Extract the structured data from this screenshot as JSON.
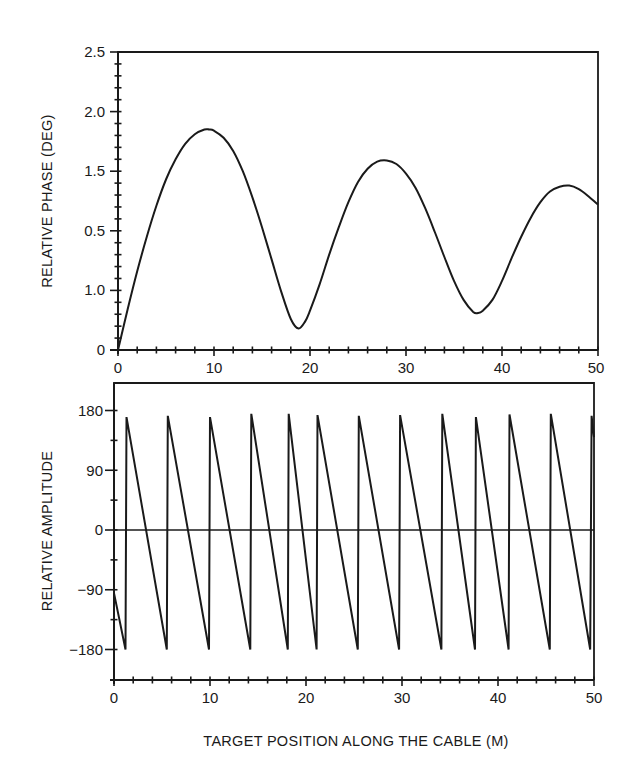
{
  "chart_data": [
    {
      "id": "phase",
      "type": "line",
      "title": "",
      "xlabel": "",
      "ylabel": "RELATIVE PHASE (DEG)",
      "xlim": [
        0,
        50
      ],
      "ylim": [
        0,
        2.5
      ],
      "x_ticks": [
        0,
        10,
        20,
        30,
        40,
        50
      ],
      "x_tick_labels": [
        "0",
        "10",
        "20",
        "30",
        "40",
        "50"
      ],
      "y_ticks": [
        2.5,
        2.0,
        1.5,
        1.0,
        0.5,
        0
      ],
      "y_tick_labels": [
        "2.5",
        "2.0",
        "1.5",
        "0.5",
        "1.0",
        "0"
      ],
      "grid": false,
      "legend": null,
      "series": [
        {
          "name": "Relative phase",
          "x": [
            0,
            1,
            2,
            3,
            4,
            5,
            6,
            7,
            8,
            9,
            9.5,
            10,
            11,
            12,
            13,
            14,
            15,
            16,
            17,
            18,
            18.8,
            19.5,
            20,
            21,
            22,
            23,
            24,
            25,
            26,
            27,
            28,
            29,
            30,
            31,
            32,
            33,
            34,
            35,
            36,
            37,
            37.5,
            38,
            39,
            40,
            41,
            42,
            43,
            44,
            45,
            46,
            47,
            48,
            49,
            50
          ],
          "values": [
            0,
            0.34,
            0.66,
            0.95,
            1.21,
            1.43,
            1.6,
            1.73,
            1.81,
            1.85,
            1.85,
            1.84,
            1.78,
            1.67,
            1.5,
            1.28,
            1.03,
            0.76,
            0.49,
            0.26,
            0.18,
            0.24,
            0.33,
            0.55,
            0.8,
            1.03,
            1.24,
            1.41,
            1.52,
            1.58,
            1.59,
            1.56,
            1.48,
            1.36,
            1.19,
            0.99,
            0.78,
            0.58,
            0.42,
            0.32,
            0.31,
            0.33,
            0.42,
            0.58,
            0.77,
            0.95,
            1.11,
            1.24,
            1.33,
            1.37,
            1.38,
            1.35,
            1.29,
            1.22
          ]
        }
      ]
    },
    {
      "id": "amplitude",
      "type": "line",
      "title": "",
      "xlabel": "TARGET POSITION ALONG THE CABLE (M)",
      "ylabel": "RELATIVE AMPLITUDE",
      "xlim": [
        0,
        50
      ],
      "ylim": [
        -225,
        225
      ],
      "x_ticks": [
        0,
        10,
        20,
        30,
        40,
        50
      ],
      "x_tick_labels": [
        "0",
        "10",
        "20",
        "30",
        "40",
        "50"
      ],
      "y_ticks": [
        180,
        90,
        0,
        -90,
        -180
      ],
      "y_tick_labels": [
        "180",
        "90",
        "0",
        "−90",
        "−180"
      ],
      "grid": false,
      "zero_line": true,
      "legend": null,
      "series": [
        {
          "name": "Relative amplitude (sawtooth)",
          "x": [
            0,
            1.2,
            1.3,
            5.5,
            5.6,
            9.9,
            10.0,
            14.2,
            14.3,
            18.1,
            18.2,
            21.1,
            21.2,
            25.4,
            25.5,
            29.7,
            29.8,
            34.1,
            34.2,
            37.6,
            37.7,
            41.1,
            41.2,
            45.4,
            45.5,
            49.6,
            49.75,
            50
          ],
          "values": [
            -95,
            -180,
            170,
            -180,
            172,
            -180,
            170,
            -180,
            175,
            -180,
            175,
            -180,
            173,
            -180,
            172,
            -180,
            173,
            -180,
            175,
            -180,
            170,
            -180,
            174,
            -180,
            175,
            -180,
            172,
            140
          ]
        }
      ]
    }
  ],
  "top_panel": {
    "ylabel": "RELATIVE PHASE (DEG)",
    "y_tick_labels": [
      "2.5",
      "2.0",
      "1.5",
      "0.5",
      "1.0",
      "0"
    ],
    "x_tick_labels": [
      "0",
      "10",
      "20",
      "30",
      "40",
      "50"
    ]
  },
  "bottom_panel": {
    "ylabel": "RELATIVE AMPLITUDE",
    "y_tick_labels": [
      "180",
      "90",
      "0",
      "−90",
      "−180"
    ],
    "x_tick_labels": [
      "0",
      "10",
      "20",
      "30",
      "40",
      "50"
    ],
    "xlabel": "TARGET POSITION ALONG THE CABLE (M)"
  },
  "colors": {
    "ink": "#1a1a1a",
    "background": "#ffffff"
  }
}
